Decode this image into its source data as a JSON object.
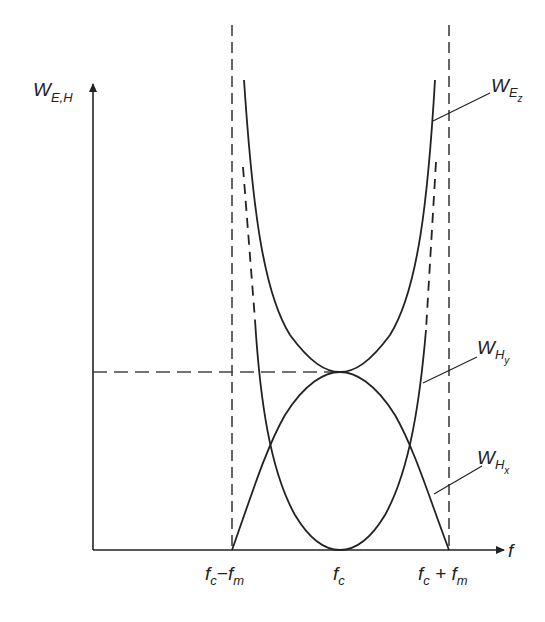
{
  "diagram": {
    "y_axis": {
      "label_main": "W",
      "label_sub": "E,H"
    },
    "x_axis": {
      "label": "f"
    },
    "x_ticks": [
      {
        "main1": "f",
        "sub1": "c",
        "op": "−",
        "main2": "f",
        "sub2": "m"
      },
      {
        "main1": "f",
        "sub1": "c"
      },
      {
        "main1": "f",
        "sub1": "c",
        "op": " + ",
        "main2": "f",
        "sub2": "m"
      }
    ],
    "curves": [
      {
        "id": "W_Ez",
        "label_main": "W",
        "label_sub": "E",
        "label_subsub": "z",
        "shape": "upper U-curve, asymptotic to fc±fm, touching the dome at fc"
      },
      {
        "id": "W_Hy",
        "label_main": "W",
        "label_sub": "H",
        "label_subsub": "y",
        "shape": "lower U-curve, zero at fc, dashed near asymptotes"
      },
      {
        "id": "W_Hx",
        "label_main": "W",
        "label_sub": "H",
        "label_subsub": "x",
        "shape": "dome, zero at fc±fm, max at fc"
      }
    ],
    "colors": {
      "line": "#222222",
      "background": "#ffffff"
    }
  }
}
